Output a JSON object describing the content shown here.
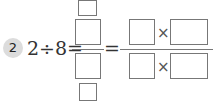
{
  "problem": {
    "number": "2",
    "expression": "2÷8=",
    "equals_sign": "=",
    "times_sign": "×"
  },
  "answer_boxes": {
    "top_multiplier": "",
    "numerator": "",
    "denominator": "",
    "bottom_multiplier": "",
    "right_numerator_left": "",
    "right_numerator_right": "",
    "right_denominator_left": "",
    "right_denominator_right": ""
  },
  "colors": {
    "badge_bg": "#dcdcdc",
    "box_border": "#777777",
    "text": "#333333"
  }
}
